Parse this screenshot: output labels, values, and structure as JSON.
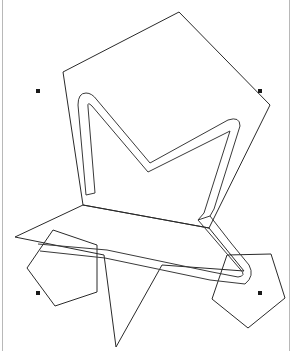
{
  "canvas": {
    "background": "#ffffff",
    "stroke_color": "#2a2a2a",
    "frame_color": "#b8b8b8"
  },
  "shapes": [
    {
      "name": "large-pentagon",
      "kind": "pentagon"
    },
    {
      "name": "star",
      "kind": "star"
    },
    {
      "name": "small-pentagon-left",
      "kind": "pentagon"
    },
    {
      "name": "small-pentagon-right",
      "kind": "pentagon"
    },
    {
      "name": "selected-path",
      "kind": "outlined-stroke-path",
      "selected": true
    }
  ],
  "selection": {
    "handles": [
      "top-left",
      "top-right",
      "bottom-left",
      "bottom-right"
    ]
  }
}
